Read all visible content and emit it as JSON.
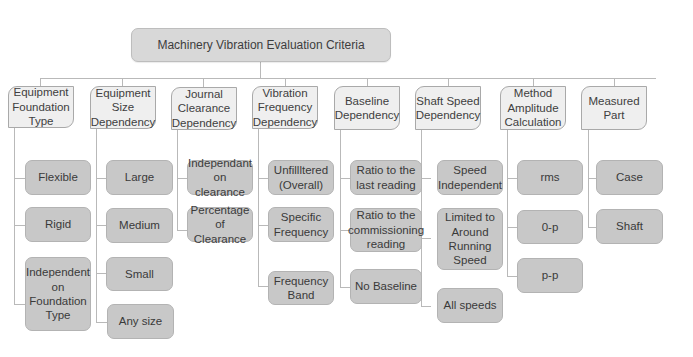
{
  "diagram": {
    "title": "Machinery Vibration Evaluation Criteria",
    "categories": [
      {
        "label": "Equipment Foundation Type",
        "children": [
          "Flexible",
          "Rigid",
          "Independent on Foundation Type"
        ]
      },
      {
        "label": "Equipment Size Dependency",
        "children": [
          "Large",
          "Medium",
          "Small",
          "Any size"
        ]
      },
      {
        "label": "Journal Clearance Dependency",
        "children": [
          "Independant on clearance",
          "Percentage of Clearance"
        ]
      },
      {
        "label": "Vibration Frequency Dependency",
        "children": [
          "Unfillltered (Overall)",
          "Specific Frequency",
          "Frequency Band"
        ]
      },
      {
        "label": "Baseline Dependency",
        "children": [
          "Ratio to the last reading",
          "Ratio to the commissioning reading",
          "No Baseline"
        ]
      },
      {
        "label": "Shaft Speed Dependency",
        "children": [
          "Speed Independent",
          "Limited to Around Running Speed",
          "All speeds"
        ]
      },
      {
        "label": "Method Amplitude Calculation",
        "children": [
          "rms",
          "0-p",
          "p-p"
        ]
      },
      {
        "label": "Measured Part",
        "children": [
          "Case",
          "Shaft"
        ]
      }
    ],
    "colors": {
      "root_fill": "#d8d8d8",
      "category_fill": "#efefef",
      "leaf_fill": "#c8c8c8",
      "connector": "#b9b9b9"
    }
  }
}
